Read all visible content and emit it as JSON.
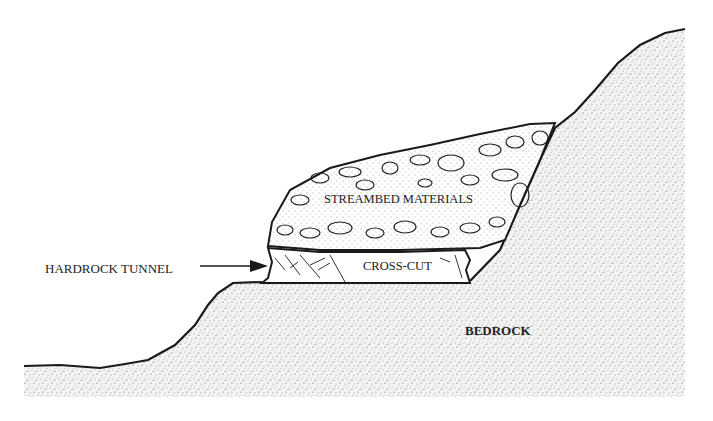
{
  "diagram": {
    "type": "geologic-cross-section",
    "labels": {
      "hardrock_tunnel": "HARDROCK TUNNEL",
      "streambed_materials": "STREAMBED MATERIALS",
      "cross_cut": "CROSS-CUT",
      "bedrock": "BEDROCK"
    },
    "colors": {
      "outline": "#1a1a1a",
      "stipple": "#8a8a8a",
      "background": "#ffffff"
    }
  }
}
